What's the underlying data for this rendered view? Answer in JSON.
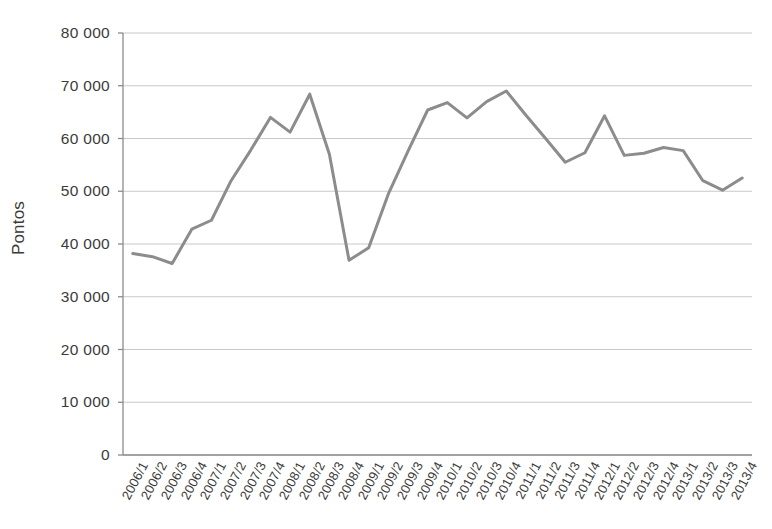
{
  "chart_data": {
    "type": "line",
    "title": "",
    "xlabel": "",
    "ylabel": "Pontos",
    "ylim": [
      0,
      80000
    ],
    "ytick_labels": [
      "80 000",
      "70 000",
      "60 000",
      "50 000",
      "40 000",
      "30 000",
      "20 000",
      "10 000",
      "0"
    ],
    "ytick_values": [
      80000,
      70000,
      60000,
      50000,
      40000,
      30000,
      20000,
      10000,
      0
    ],
    "grid": "horizontal",
    "legend": "none",
    "line_color": "#8c8c8c",
    "gridline_color": "#c9c9c9",
    "axis_color": "#8c8c8c",
    "background_color": "#ffffff",
    "categories": [
      "2006/1",
      "2006/2",
      "2006/3",
      "2006/4",
      "2007/1",
      "2007/2",
      "2007/3",
      "2007/4",
      "2008/1",
      "2008/2",
      "2008/3",
      "2008/4",
      "2009/1",
      "2009/2",
      "2009/3",
      "2009/4",
      "2010/1",
      "2010/2",
      "2010/3",
      "2010/4",
      "2011/1",
      "2011/2",
      "2011/3",
      "2011/4",
      "2012/1",
      "2012/2",
      "2012/3",
      "2012/4",
      "2013/1",
      "2013/2",
      "2013/3",
      "2013/4"
    ],
    "values": [
      38200,
      37600,
      36300,
      42800,
      44500,
      52000,
      57800,
      64000,
      61200,
      68400,
      57000,
      36900,
      39300,
      49500,
      57600,
      65400,
      66800,
      63900,
      67000,
      69000,
      64400,
      60000,
      55500,
      57300,
      64300,
      56800,
      57200,
      58300,
      57700,
      52000,
      50200,
      52500
    ],
    "series_name": "Pontos"
  }
}
